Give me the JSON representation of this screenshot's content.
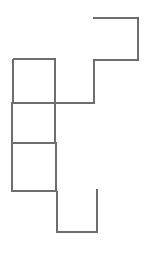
{
  "canvas": {
    "width": 151,
    "height": 254,
    "background_color": "#ffffff",
    "description": "Rectilinear polyline outline figure on plain white background"
  },
  "figure": {
    "name": "rectilinear-outline",
    "stroke_color": "#6e6e6e",
    "stroke_width": 1.3,
    "fill": "none",
    "segment_count": 22,
    "segments": [
      {
        "name": "top-edge",
        "orientation": "horizontal",
        "x1": 93,
        "y1": 18,
        "x2": 138,
        "y2": 18
      },
      {
        "name": "upper-right-edge",
        "orientation": "vertical",
        "x1": 138,
        "y1": 18,
        "x2": 138,
        "y2": 60
      },
      {
        "name": "upper-right-under",
        "orientation": "horizontal",
        "x1": 138,
        "y1": 60,
        "x2": 94,
        "y2": 60
      },
      {
        "name": "center-upper-right",
        "orientation": "vertical",
        "x1": 94,
        "y1": 60,
        "x2": 94,
        "y2": 103
      },
      {
        "name": "mid-horizontal",
        "orientation": "horizontal",
        "x1": 94,
        "y1": 103,
        "x2": 12,
        "y2": 103
      },
      {
        "name": "left-step-down",
        "orientation": "vertical",
        "x1": 12,
        "y1": 103,
        "x2": 12,
        "y2": 143
      },
      {
        "name": "left-step-right",
        "orientation": "horizontal",
        "x1": 12,
        "y1": 143,
        "x2": 56,
        "y2": 143
      },
      {
        "name": "notch-down",
        "orientation": "vertical",
        "x1": 56,
        "y1": 143,
        "x2": 56,
        "y2": 191
      },
      {
        "name": "notch-left",
        "orientation": "horizontal",
        "x1": 56,
        "y1": 191,
        "x2": 12,
        "y2": 191
      },
      {
        "name": "lower-left-edge",
        "orientation": "vertical",
        "x1": 12,
        "y1": 191,
        "x2": 12,
        "y2": 143
      },
      {
        "name": "square-left-edge",
        "orientation": "vertical",
        "x1": 13,
        "y1": 59,
        "x2": 13,
        "y2": 103
      },
      {
        "name": "square-top-edge",
        "orientation": "horizontal",
        "x1": 13,
        "y1": 59,
        "x2": 55,
        "y2": 59
      },
      {
        "name": "square-right-edge",
        "orientation": "vertical",
        "x1": 55,
        "y1": 59,
        "x2": 55,
        "y2": 143
      },
      {
        "name": "bottom-block-left",
        "orientation": "vertical",
        "x1": 57,
        "y1": 191,
        "x2": 57,
        "y2": 232
      },
      {
        "name": "bottom-edge",
        "orientation": "horizontal",
        "x1": 57,
        "y1": 232,
        "x2": 97,
        "y2": 232
      },
      {
        "name": "bottom-block-right",
        "orientation": "vertical",
        "x1": 97,
        "y1": 232,
        "x2": 97,
        "y2": 189
      }
    ],
    "path_d": "M 93 18 L 138 18 L 138 60 L 94 60 L 94 103 L 12 103 L 12 143 L 56 143 L 56 191 L 12 191 M 12 191 L 12 143 M 13 103 L 13 59 L 55 59 L 55 143 M 57 191 L 57 232 L 97 232 L 97 189"
  },
  "annotations": {
    "title": "",
    "labels": []
  }
}
